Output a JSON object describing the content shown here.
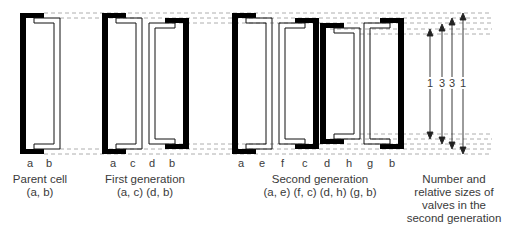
{
  "colors": {
    "valve_outer": "#000000",
    "valve_inner_line": "#111111",
    "dashed_guides": "#9a9a9a",
    "arrows": "#222222",
    "text": "#3a3a3a"
  },
  "stages": [
    {
      "id": "parent",
      "caption_line1": "Parent cell",
      "caption_line2": "(a, b)",
      "valve_labels": [
        "a",
        "b"
      ]
    },
    {
      "id": "first",
      "caption_line1": "First generation",
      "caption_line2": "(a, c) (d, b)",
      "valve_labels": [
        "a",
        "c",
        "d",
        "b"
      ]
    },
    {
      "id": "second",
      "caption_line1": "Second generation",
      "caption_line2": "(a, e) (f, c) (d, h) (g, b)",
      "valve_labels": [
        "a",
        "e",
        "f",
        "c",
        "d",
        "h",
        "g",
        "b"
      ]
    }
  ],
  "sizes": {
    "caption_line1": "Number and",
    "caption_line2": "relative sizes of",
    "caption_line3": "valves in the",
    "caption_line4": "second generation",
    "values": [
      "1",
      "3",
      "3",
      "1"
    ]
  }
}
